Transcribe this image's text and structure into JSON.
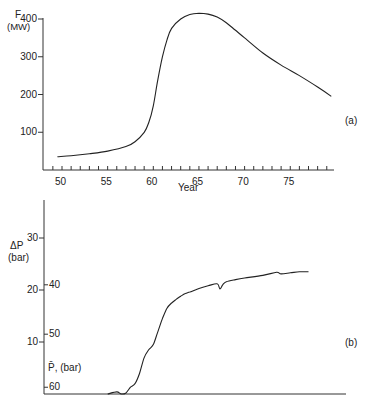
{
  "chart_data": [
    {
      "id": "a",
      "type": "line",
      "panel_label": "(a)",
      "title": "",
      "xlabel": "Year",
      "ylabel": "F (MW)",
      "ylabel_line1": "F",
      "ylabel_line2": "(MW)",
      "xlim": [
        48,
        80
      ],
      "ylim": [
        0,
        400
      ],
      "xticks": [
        50,
        55,
        60,
        65,
        70,
        75
      ],
      "yticks": [
        100,
        200,
        300,
        400
      ],
      "grid": false,
      "x": [
        49.5,
        51,
        53,
        55,
        57,
        58,
        59,
        59.5,
        60,
        60.5,
        61,
        61.5,
        62,
        63,
        64,
        65,
        66,
        67,
        68,
        69,
        70,
        72,
        74,
        76,
        78,
        79.5
      ],
      "y": [
        35,
        38,
        43,
        50,
        62,
        75,
        100,
        125,
        170,
        240,
        300,
        345,
        375,
        400,
        412,
        415,
        413,
        405,
        390,
        370,
        350,
        310,
        278,
        250,
        220,
        195
      ]
    },
    {
      "id": "b",
      "type": "line",
      "panel_label": "(b)",
      "title": "",
      "xlabel": "",
      "ylabel": "ΔP (bar)",
      "ylabel_line1": "ΔP",
      "ylabel_line2": "(bar)",
      "secondary_axis_label": "P̄, (bar)",
      "xlim": [
        48,
        80
      ],
      "ylim": [
        0,
        36
      ],
      "yticks": [
        10,
        20,
        30
      ],
      "secondary_yticks": [
        {
          "label": "40",
          "value": 21
        },
        {
          "label": "50",
          "value": 11.5
        },
        {
          "label": "60",
          "value": 1.3
        }
      ],
      "grid": false,
      "x": [
        55,
        56,
        56.5,
        57,
        57.5,
        58,
        58.5,
        59,
        59.5,
        60,
        60.5,
        61,
        61.5,
        62,
        62.5,
        63,
        63.5,
        64,
        65,
        66,
        67,
        67.3,
        67.6,
        68,
        69,
        70,
        72,
        73.5,
        74,
        75,
        76,
        77
      ],
      "y": [
        0,
        0.4,
        0,
        0.2,
        1.3,
        2,
        4,
        7,
        8.5,
        9.5,
        12,
        14.5,
        16.5,
        17.5,
        18.2,
        18.8,
        19.3,
        19.6,
        20.3,
        20.8,
        21.2,
        20.2,
        21,
        21.6,
        22,
        22.3,
        22.8,
        23.4,
        23.1,
        23.3,
        23.5,
        23.5
      ]
    }
  ]
}
